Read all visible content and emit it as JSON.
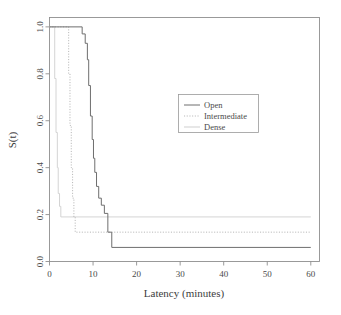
{
  "chart_data": {
    "type": "line",
    "title": "",
    "xlabel": "Latency (minutes)",
    "ylabel": "S(t)",
    "xlim": [
      0,
      62
    ],
    "ylim": [
      0,
      1.04
    ],
    "grid": false,
    "legend_position": "center-right",
    "x_ticks": [
      0,
      10,
      20,
      30,
      40,
      50,
      60
    ],
    "x_tick_labels": [
      "0",
      "10",
      "20",
      "30",
      "40",
      "50",
      "60"
    ],
    "y_ticks": [
      0.0,
      0.2,
      0.4,
      0.6,
      0.8,
      1.0
    ],
    "y_tick_labels": [
      "0.0",
      "0.2",
      "0.4",
      "0.6",
      "0.8",
      "1.0"
    ],
    "series": [
      {
        "name": "Open",
        "style": "solid",
        "color": "#6e6e6e",
        "steps": [
          [
            0.0,
            1.0
          ],
          [
            7.5,
            1.0
          ],
          [
            7.5,
            0.97
          ],
          [
            8.2,
            0.97
          ],
          [
            8.2,
            0.93
          ],
          [
            8.7,
            0.93
          ],
          [
            8.7,
            0.86
          ],
          [
            9.0,
            0.86
          ],
          [
            9.0,
            0.75
          ],
          [
            9.4,
            0.75
          ],
          [
            9.4,
            0.62
          ],
          [
            9.8,
            0.62
          ],
          [
            9.8,
            0.52
          ],
          [
            10.1,
            0.52
          ],
          [
            10.1,
            0.44
          ],
          [
            10.4,
            0.44
          ],
          [
            10.4,
            0.38
          ],
          [
            10.8,
            0.38
          ],
          [
            10.8,
            0.32
          ],
          [
            11.3,
            0.32
          ],
          [
            11.3,
            0.27
          ],
          [
            11.9,
            0.27
          ],
          [
            11.9,
            0.24
          ],
          [
            12.6,
            0.24
          ],
          [
            12.6,
            0.205
          ],
          [
            13.4,
            0.205
          ],
          [
            13.4,
            0.125
          ],
          [
            14.3,
            0.125
          ],
          [
            14.3,
            0.06
          ],
          [
            60.0,
            0.06
          ]
        ],
        "final_value": 0.06
      },
      {
        "name": "Intermediate",
        "style": "dotted",
        "color": "#b4b4b4",
        "steps": [
          [
            0.0,
            1.0
          ],
          [
            4.4,
            1.0
          ],
          [
            4.4,
            0.8
          ],
          [
            4.7,
            0.8
          ],
          [
            4.7,
            0.58
          ],
          [
            5.0,
            0.58
          ],
          [
            5.0,
            0.4
          ],
          [
            5.3,
            0.4
          ],
          [
            5.3,
            0.27
          ],
          [
            5.6,
            0.27
          ],
          [
            5.6,
            0.19
          ],
          [
            5.9,
            0.19
          ],
          [
            5.9,
            0.125
          ],
          [
            60.0,
            0.125
          ]
        ],
        "final_value": 0.125
      },
      {
        "name": "Dense",
        "style": "solid-light",
        "color": "#d2d2d2",
        "steps": [
          [
            0.0,
            1.0
          ],
          [
            1.2,
            1.0
          ],
          [
            1.2,
            0.78
          ],
          [
            1.5,
            0.78
          ],
          [
            1.5,
            0.55
          ],
          [
            1.8,
            0.55
          ],
          [
            1.8,
            0.4
          ],
          [
            2.0,
            0.4
          ],
          [
            2.0,
            0.29
          ],
          [
            2.3,
            0.29
          ],
          [
            2.3,
            0.235
          ],
          [
            2.6,
            0.235
          ],
          [
            2.6,
            0.19
          ],
          [
            60.0,
            0.19
          ]
        ],
        "final_value": 0.19
      }
    ],
    "legend_entries": [
      {
        "label": "Open",
        "style": "solid",
        "color": "#6e6e6e"
      },
      {
        "label": "Intermediate",
        "style": "dotted",
        "color": "#b4b4b4"
      },
      {
        "label": "Dense",
        "style": "solid-light",
        "color": "#cccccc"
      }
    ]
  },
  "colors": {
    "background": "#ffffff",
    "frame": "#8f8f8f",
    "text": "#3d3d3d",
    "open": "#6e6e6e",
    "intermediate": "#b4b4b4",
    "dense": "#d2d2d2"
  }
}
